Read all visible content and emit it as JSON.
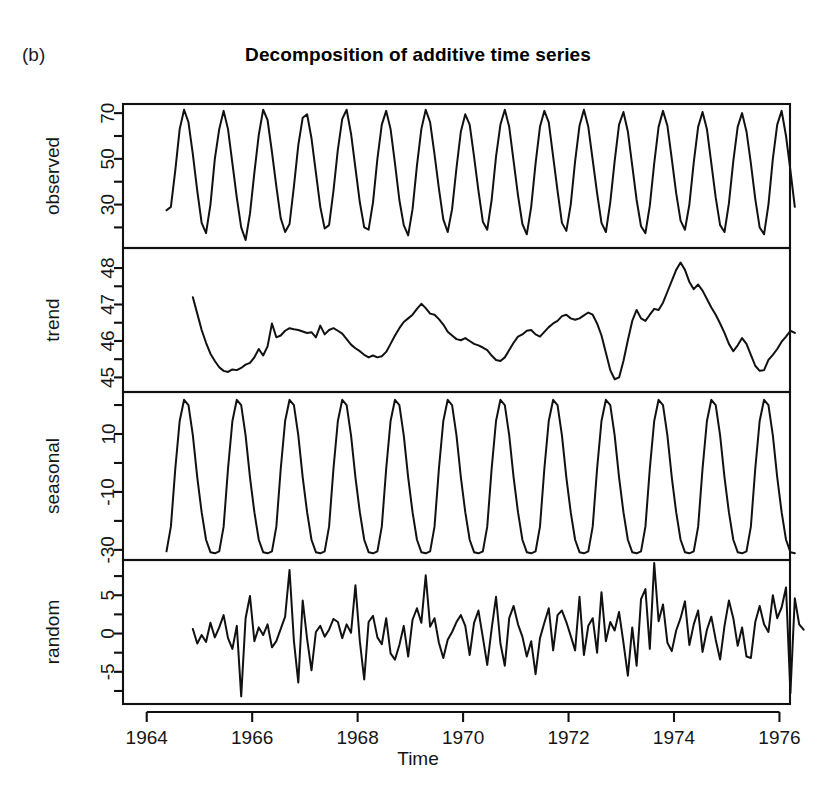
{
  "figure": {
    "letter": "(b)",
    "title": "Decomposition of additive time series",
    "xlabel": "Time",
    "background": "#ffffff",
    "line_color": "#111111"
  },
  "xaxis": {
    "ticks": [
      1964,
      1966,
      1968,
      1970,
      1972,
      1974,
      1976
    ],
    "tick_labels": [
      "1964",
      "1966",
      "1968",
      "1970",
      "1972",
      "1974",
      "1976"
    ],
    "range": [
      1963.55,
      1976.2
    ],
    "minor_ticks": [
      1965,
      1967,
      1969,
      1971,
      1973,
      1975
    ]
  },
  "chart_data": {
    "type": "line",
    "title": "Decomposition of additive time series",
    "xlabel": "Time",
    "ylabel": "",
    "grid": false,
    "legend": "none",
    "x_start": 1964.375,
    "x_step": 0.08333,
    "panels": [
      {
        "name": "observed",
        "ylabel": "observed",
        "yticks": [
          10,
          30,
          50,
          70
        ],
        "ytick_labels": [
          "10",
          "30",
          "50",
          "70"
        ],
        "ylim": [
          11,
          74
        ],
        "values": [
          27.5,
          29.0,
          45.0,
          63.0,
          71.5,
          66.0,
          52.0,
          36.0,
          22.0,
          17.5,
          30.0,
          50.0,
          63.0,
          71.0,
          63.0,
          48.0,
          33.0,
          20.0,
          14.5,
          26.0,
          44.0,
          60.5,
          71.5,
          67.0,
          53.0,
          38.0,
          24.0,
          18.0,
          21.5,
          38.0,
          56.0,
          68.0,
          69.5,
          59.0,
          44.0,
          29.0,
          19.5,
          21.0,
          36.0,
          54.0,
          67.5,
          71.5,
          61.0,
          46.0,
          31.0,
          20.0,
          19.0,
          31.0,
          50.0,
          65.0,
          71.0,
          63.0,
          48.0,
          32.0,
          21.0,
          16.5,
          28.0,
          47.0,
          63.0,
          71.5,
          66.0,
          52.0,
          37.0,
          23.5,
          18.0,
          28.0,
          46.0,
          62.0,
          69.5,
          65.0,
          51.0,
          36.0,
          22.5,
          19.0,
          32.0,
          51.0,
          65.0,
          71.5,
          64.0,
          49.0,
          34.0,
          21.5,
          17.0,
          29.0,
          48.0,
          64.0,
          71.0,
          66.0,
          51.0,
          36.0,
          22.0,
          18.5,
          30.0,
          49.0,
          64.5,
          71.5,
          64.0,
          49.5,
          35.0,
          22.0,
          18.0,
          31.0,
          49.0,
          65.0,
          70.5,
          62.0,
          47.0,
          32.0,
          20.5,
          17.5,
          29.5,
          48.0,
          64.0,
          71.0,
          64.5,
          50.0,
          35.0,
          23.0,
          19.0,
          30.0,
          48.5,
          64.0,
          70.5,
          63.0,
          48.0,
          33.0,
          21.0,
          18.0,
          30.5,
          49.0,
          64.0,
          70.0,
          62.0,
          48.0,
          32.5,
          20.0,
          17.0,
          30.0,
          50.0,
          65.0,
          71.0,
          60.0,
          45.0,
          29.0
        ]
      },
      {
        "name": "trend",
        "ylabel": "trend",
        "yticks": [
          45,
          46,
          47,
          48
        ],
        "ytick_labels": [
          "45",
          "46",
          "47",
          "48"
        ],
        "ylim": [
          44.6,
          48.55
        ],
        "start_offset": 6,
        "end_offset": 6,
        "values": [
          47.2,
          46.75,
          46.3,
          45.95,
          45.65,
          45.45,
          45.28,
          45.18,
          45.15,
          45.22,
          45.2,
          45.26,
          45.35,
          45.4,
          45.55,
          45.78,
          45.6,
          45.85,
          46.48,
          46.1,
          46.15,
          46.28,
          46.35,
          46.32,
          46.3,
          46.26,
          46.22,
          46.24,
          46.1,
          46.42,
          46.18,
          46.3,
          46.35,
          46.28,
          46.2,
          46.05,
          45.9,
          45.8,
          45.72,
          45.62,
          45.55,
          45.6,
          45.55,
          45.58,
          45.7,
          45.92,
          46.15,
          46.35,
          46.52,
          46.62,
          46.72,
          46.88,
          47.02,
          46.9,
          46.75,
          46.72,
          46.6,
          46.45,
          46.25,
          46.15,
          46.05,
          46.02,
          46.08,
          46.0,
          45.92,
          45.88,
          45.82,
          45.75,
          45.6,
          45.48,
          45.45,
          45.55,
          45.75,
          45.95,
          46.12,
          46.18,
          46.28,
          46.3,
          46.18,
          46.12,
          46.25,
          46.38,
          46.48,
          46.55,
          46.68,
          46.72,
          46.62,
          46.58,
          46.62,
          46.7,
          46.78,
          46.72,
          46.48,
          46.15,
          45.68,
          45.2,
          44.95,
          45.0,
          45.45,
          46.02,
          46.55,
          46.85,
          46.62,
          46.55,
          46.72,
          46.88,
          46.85,
          47.05,
          47.35,
          47.65,
          47.95,
          48.15,
          47.95,
          47.62,
          47.42,
          47.55,
          47.38,
          47.15,
          46.92,
          46.72,
          46.48,
          46.22,
          45.92,
          45.72,
          45.88,
          46.08,
          45.92,
          45.62,
          45.32,
          45.18,
          45.2,
          45.48,
          45.62,
          45.78,
          45.98,
          46.12,
          46.28,
          46.22
        ]
      },
      {
        "name": "seasonal",
        "ylabel": "seasonal",
        "yticks": [
          -30,
          -10,
          10
        ],
        "ytick_labels": [
          "-30",
          "-10",
          "10"
        ],
        "ylim": [
          -33.5,
          24.5
        ],
        "period": 12,
        "pattern": [
          -30.5,
          -22.0,
          -2.0,
          14.5,
          21.8,
          20.0,
          9.5,
          -5.0,
          -17.0,
          -26.5,
          -30.8,
          -31.2
        ]
      },
      {
        "name": "random",
        "ylabel": "random",
        "yticks": [
          -5,
          0,
          5
        ],
        "ytick_labels": [
          "-5",
          "0",
          "5"
        ],
        "ylim": [
          -9.2,
          9.6
        ],
        "start_offset": 6,
        "end_offset": 6,
        "values": [
          0.6,
          -1.3,
          -0.2,
          -1.1,
          1.4,
          -0.5,
          0.8,
          2.4,
          -0.6,
          -2.0,
          1.0,
          -8.2,
          2.0,
          4.9,
          -1.0,
          0.8,
          -0.2,
          1.2,
          -1.8,
          -1.0,
          0.6,
          2.2,
          8.3,
          -1.0,
          -6.4,
          4.3,
          -0.7,
          -4.8,
          0.2,
          1.0,
          -0.4,
          0.5,
          1.9,
          1.5,
          -0.6,
          1.2,
          0.1,
          6.3,
          -1.0,
          -6.0,
          1.5,
          2.3,
          -0.5,
          -1.4,
          2.0,
          -2.6,
          -3.4,
          -1.5,
          1.0,
          -3.0,
          1.8,
          3.3,
          1.4,
          7.6,
          0.9,
          2.0,
          -1.2,
          -3.2,
          -0.8,
          0.2,
          1.5,
          2.4,
          1.0,
          -2.8,
          1.4,
          3.0,
          -0.5,
          -4.1,
          0.6,
          4.8,
          -1.3,
          -4.2,
          2.0,
          3.6,
          1.2,
          -0.4,
          -3.0,
          -1.0,
          -5.3,
          -0.6,
          1.4,
          3.3,
          -2.2,
          2.4,
          3.0,
          1.5,
          -0.3,
          -2.2,
          4.8,
          -2.8,
          1.0,
          2.0,
          -2.5,
          5.4,
          -1.0,
          1.5,
          0.4,
          2.8,
          -1.2,
          -5.5,
          0.8,
          -4.2,
          4.5,
          5.8,
          -2.0,
          9.2,
          1.6,
          3.8,
          -1.2,
          -2.3,
          0.4,
          2.0,
          4.2,
          -1.5,
          1.2,
          3.0,
          -2.4,
          0.5,
          2.2,
          -0.8,
          -3.4,
          1.0,
          4.3,
          2.0,
          -1.6,
          0.8,
          -3.0,
          -3.2,
          1.5,
          3.6,
          1.2,
          0.2,
          5.0,
          2.0,
          3.4,
          6.0,
          -7.8,
          4.6,
          1.2,
          0.5
        ]
      }
    ]
  },
  "layout": {
    "plot_left": 123,
    "plot_right": 790,
    "panel_tops": [
      104,
      248,
      392,
      560
    ],
    "panel_bottoms": [
      248,
      392,
      560,
      704
    ]
  }
}
